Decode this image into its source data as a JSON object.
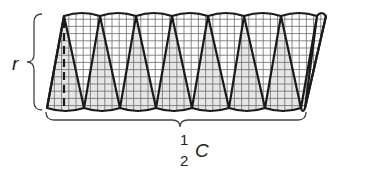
{
  "diagram": {
    "sector_count": 16,
    "labels": {
      "height": "r",
      "base_numerator": "1",
      "base_denominator": "2",
      "base_variable": "C"
    },
    "colors": {
      "outline": "#1a1a1a",
      "grid": "#6b6b6b",
      "shaded_fill": "#e6e6e6",
      "unshaded_fill": "#ffffff",
      "brace": "#444444",
      "text": "#222222"
    },
    "geometry": {
      "top_y": 16,
      "bottom_y": 108,
      "top_points_x": [
        64,
        100,
        136,
        172,
        208,
        244,
        281,
        317,
        326
      ],
      "bottom_points_x": [
        47,
        84,
        120,
        156,
        192,
        229,
        265,
        301,
        305
      ],
      "grid_spacing": 7.2,
      "arc_bulge": 3
    }
  }
}
